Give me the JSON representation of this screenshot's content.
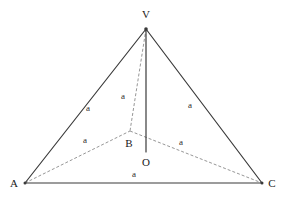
{
  "figure": {
    "kind": "geometry-diagram",
    "background_color": "#ffffff",
    "solid_stroke_color": "#3a3a3a",
    "dashed_stroke_color": "#8a8a8a",
    "label_color": "#1a1a1a",
    "solid_stroke_width": 1.2,
    "dashed_stroke_width": 0.9,
    "dash_pattern": "3,2"
  },
  "points": {
    "V": {
      "label": "V",
      "x": 146,
      "y": 29,
      "label_x": 146,
      "label_y": 18
    },
    "A": {
      "label": "A",
      "x": 25,
      "y": 183,
      "label_x": 14,
      "label_y": 187
    },
    "C": {
      "label": "C",
      "x": 262,
      "y": 183,
      "label_x": 272,
      "label_y": 187
    },
    "B": {
      "label": "B",
      "x": 130,
      "y": 131,
      "label_x": 129,
      "label_y": 147
    },
    "O": {
      "label": "O",
      "x": 146,
      "y": 152,
      "label_x": 146,
      "label_y": 166
    }
  },
  "edges": [
    {
      "name": "edge-AV",
      "from": "A",
      "to": "V",
      "style": "solid"
    },
    {
      "name": "edge-VC",
      "from": "V",
      "to": "C",
      "style": "solid"
    },
    {
      "name": "edge-AC",
      "from": "A",
      "to": "C",
      "style": "solid"
    },
    {
      "name": "edge-VO",
      "from": "V",
      "to": "O",
      "style": "solid"
    },
    {
      "name": "edge-VB",
      "from": "V",
      "to": "B",
      "style": "dashed"
    },
    {
      "name": "edge-AB",
      "from": "A",
      "to": "B",
      "style": "dashed"
    },
    {
      "name": "edge-BC",
      "from": "B",
      "to": "C",
      "style": "dashed"
    }
  ],
  "edge_labels": [
    {
      "name": "length-label-av",
      "text": "a",
      "x": 88,
      "y": 111,
      "edge": "edge-AV"
    },
    {
      "name": "length-label-vc",
      "text": "a",
      "x": 190,
      "y": 108,
      "edge": "edge-VC"
    },
    {
      "name": "length-label-vb",
      "text": "a",
      "x": 123,
      "y": 99,
      "edge": "edge-VB"
    },
    {
      "name": "length-label-ab",
      "text": "a",
      "x": 85,
      "y": 143,
      "edge": "edge-AB"
    },
    {
      "name": "length-label-bc",
      "text": "a",
      "x": 181,
      "y": 145,
      "edge": "edge-BC"
    },
    {
      "name": "length-label-ac",
      "text": "a",
      "x": 134,
      "y": 177,
      "edge": "edge-AC"
    }
  ]
}
